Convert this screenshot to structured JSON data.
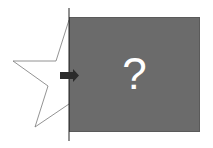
{
  "diagram": {
    "mystery_box": {
      "label": "?",
      "fill": "#6b6b6b",
      "text_color": "#ffffff"
    },
    "star": {
      "shape": "five-point-star-outline",
      "stroke": "#777777",
      "fill": "#ffffff",
      "partially_hidden": true
    },
    "arrow": {
      "direction": "right",
      "color": "#2b2b2b"
    },
    "divider_line": {
      "orientation": "vertical",
      "color": "#222222"
    }
  }
}
